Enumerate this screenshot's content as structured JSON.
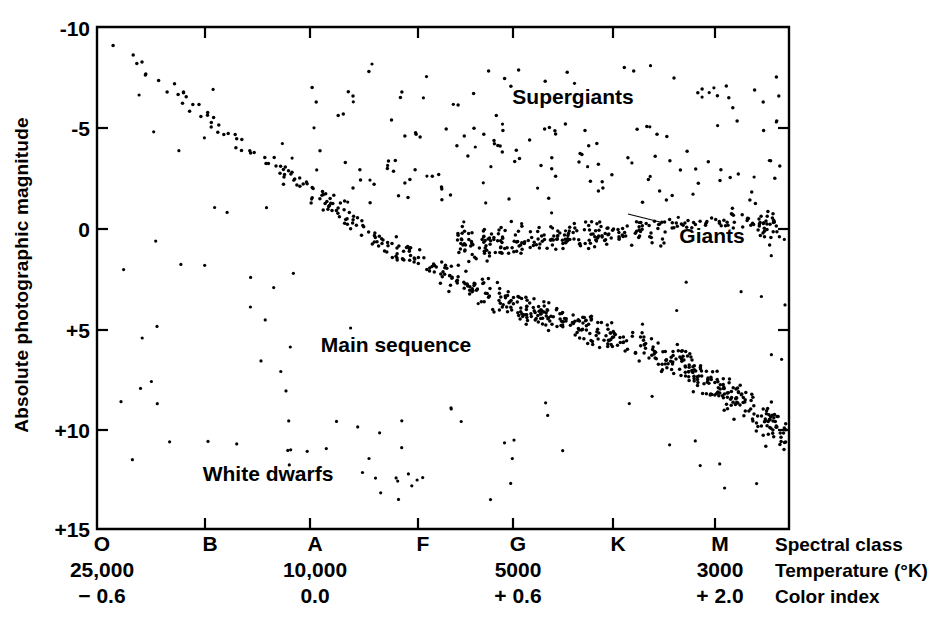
{
  "figure": {
    "background_color": "#ffffff",
    "ink_color": "#000000"
  },
  "yaxis": {
    "title": "Absolute photographic magnitude",
    "ticks": [
      "-10",
      "-5",
      "0",
      "+5",
      "+10",
      "+15"
    ],
    "tick_values": [
      -10,
      -5,
      0,
      5,
      10,
      15
    ],
    "range_top": -10,
    "range_bottom": 15
  },
  "xaxis": {
    "rows": [
      {
        "name": "Spectral class",
        "values": [
          "O",
          "B",
          "A",
          "F",
          "G",
          "K",
          "M"
        ]
      },
      {
        "name": "Temperature (°K)",
        "values": [
          "25,000",
          "",
          "10,000",
          "",
          "5000",
          "",
          "3000"
        ]
      },
      {
        "name": "Color index",
        "values": [
          "− 0.6",
          "",
          "0.0",
          "",
          "+ 0.6",
          "",
          "+ 2.0"
        ]
      }
    ],
    "tick_positions_px": [
      97,
      205,
      310,
      418,
      513,
      613,
      715
    ]
  },
  "annotations": [
    {
      "id": "supergiants",
      "label": "Supergiants",
      "x_px": 573,
      "y_px": 104
    },
    {
      "id": "giants",
      "label": "Giants",
      "x_px": 712,
      "y_px": 243
    },
    {
      "id": "main-sequence",
      "label": "Main sequence",
      "x_px": 396,
      "y_px": 352
    },
    {
      "id": "white-dwarfs",
      "label": "White dwarfs",
      "x_px": 268,
      "y_px": 481
    }
  ],
  "chart_data": {
    "type": "scatter",
    "xlabel": "Spectral class / Temperature (°K) / Color index",
    "ylabel": "Absolute photographic magnitude",
    "xlim": [
      0,
      7
    ],
    "ylim": [
      15,
      -10
    ],
    "y_inverted": true,
    "grid": false,
    "legend": "none",
    "x_tick_labels": [
      "O",
      "B",
      "A",
      "F",
      "G",
      "K",
      "M"
    ],
    "x_tick_temperatures": [
      "25,000",
      "",
      "10,000",
      "",
      "5000",
      "",
      "3000"
    ],
    "x_tick_color_index": [
      "− 0.6",
      "",
      "0.0",
      "",
      "+ 0.6",
      "",
      "+ 2.0"
    ],
    "y_tick_labels": [
      "-10",
      "-5",
      "0",
      "+5",
      "+10",
      "+15"
    ],
    "populations": [
      {
        "name": "Main sequence",
        "description": "Dense diagonal band from upper-left (hot, luminous O stars) to lower-right (cool, faint M dwarfs)",
        "count": 620,
        "path_points": [
          {
            "class_index": 0.0,
            "magnitude": -9.6
          },
          {
            "class_index": 0.6,
            "magnitude": -7.2
          },
          {
            "class_index": 1.2,
            "magnitude": -4.6
          },
          {
            "class_index": 1.9,
            "magnitude": -2.3
          },
          {
            "class_index": 2.6,
            "magnitude": 0.6
          },
          {
            "class_index": 3.3,
            "magnitude": 2.4
          },
          {
            "class_index": 4.0,
            "magnitude": 3.9
          },
          {
            "class_index": 4.8,
            "magnitude": 5.1
          },
          {
            "class_index": 5.6,
            "magnitude": 6.6
          },
          {
            "class_index": 6.3,
            "magnitude": 8.8
          },
          {
            "class_index": 6.9,
            "magnitude": 11.3
          }
        ],
        "scatter_sigma_magnitude": 0.62,
        "density_profile": "increasing toward late types"
      },
      {
        "name": "Giants",
        "description": "Dense horizontal clump (red giant branch) near magnitude 0, spanning G through M",
        "count": 330,
        "x_range_class_index": [
          3.4,
          6.6
        ],
        "magnitude_center": 0.35,
        "magnitude_slope_per_class": -0.32,
        "scatter_sigma_magnitude": 0.58
      },
      {
        "name": "Supergiants",
        "description": "Sparse scatter across the top of the diagram above magnitude -2",
        "count": 150,
        "x_range_class_index": [
          2.0,
          7.0
        ],
        "magnitude_range": [
          -8.2,
          -1.2
        ]
      },
      {
        "name": "White dwarfs",
        "description": "Sparse group of faint hot stars below the main sequence, left of centre",
        "count": 26,
        "x_range_class_index": [
          1.2,
          4.3
        ],
        "magnitude_range": [
          9.6,
          13.6
        ]
      },
      {
        "name": "Field scatter",
        "description": "Loose outlying points filling the space between the main branches",
        "count": 120,
        "x_range_class_index": [
          0.2,
          6.9
        ],
        "magnitude_range": [
          -8.5,
          13.0
        ]
      }
    ]
  },
  "geometry": {
    "plot_left_px": 97,
    "plot_right_px": 789,
    "plot_top_px": 27,
    "plot_bottom_px": 529,
    "y_tick_y_px": [
      28,
      128,
      229,
      330,
      430,
      529
    ],
    "y_tick_label_x_px": 90,
    "y_title_x_px": 28,
    "y_title_center_y_px": 275,
    "row_label_x_px": 775,
    "row_y_px": [
      551,
      577,
      603
    ]
  }
}
